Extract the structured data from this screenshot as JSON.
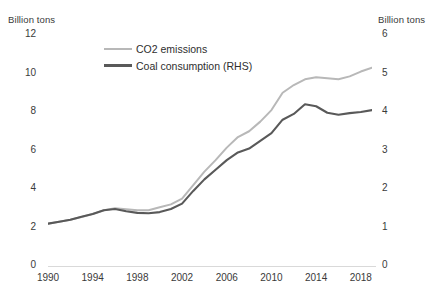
{
  "chart_data": {
    "type": "line",
    "title": "",
    "xlabel": "",
    "left_axis": {
      "label": "Billion tons",
      "ticks": [
        0,
        2,
        4,
        6,
        8,
        10,
        12
      ],
      "ylim": [
        0,
        12
      ]
    },
    "right_axis": {
      "label": "Billion tons",
      "ticks": [
        0,
        1,
        2,
        3,
        4,
        5,
        6
      ],
      "ylim": [
        0,
        6
      ]
    },
    "x": [
      1990,
      1991,
      1992,
      1993,
      1994,
      1995,
      1996,
      1997,
      1998,
      1999,
      2000,
      2001,
      2002,
      2003,
      2004,
      2005,
      2006,
      2007,
      2008,
      2009,
      2010,
      2011,
      2012,
      2013,
      2014,
      2015,
      2016,
      2017,
      2018,
      2019
    ],
    "xticks": [
      1990,
      1994,
      1998,
      2002,
      2006,
      2010,
      2014,
      2018
    ],
    "xlim": [
      1990,
      2019
    ],
    "grid": false,
    "legend_position": "top-left-inside",
    "series": [
      {
        "name": "CO2 emissions",
        "axis": "left",
        "color": "#b8b8b8",
        "unit": "Billion tons",
        "values": [
          2.2,
          2.3,
          2.4,
          2.55,
          2.7,
          2.9,
          3.0,
          2.95,
          2.9,
          2.9,
          3.05,
          3.2,
          3.5,
          4.2,
          4.9,
          5.5,
          6.15,
          6.7,
          7.0,
          7.5,
          8.1,
          9.0,
          9.4,
          9.7,
          9.8,
          9.75,
          9.7,
          9.85,
          10.1,
          10.3
        ],
        "marker": "none"
      },
      {
        "name": "Coal consumption (RHS)",
        "axis": "right",
        "color": "#595959",
        "unit": "Billion tons",
        "values": [
          1.1,
          1.15,
          1.2,
          1.28,
          1.35,
          1.45,
          1.48,
          1.42,
          1.38,
          1.37,
          1.4,
          1.48,
          1.62,
          1.95,
          2.25,
          2.5,
          2.75,
          2.95,
          3.05,
          3.25,
          3.45,
          3.8,
          3.95,
          4.2,
          4.15,
          3.98,
          3.93,
          3.97,
          4.0,
          4.05
        ],
        "marker": "none"
      }
    ],
    "annotations": []
  },
  "legend": {
    "items": [
      {
        "label": "CO2 emissions",
        "color": "#b8b8b8"
      },
      {
        "label": "Coal consumption (RHS)",
        "color": "#595959"
      }
    ]
  },
  "axes": {
    "left_title": "Billion tons",
    "right_title": "Billion tons",
    "left_tick_labels": [
      "12",
      "10",
      "8",
      "6",
      "4",
      "2",
      "0"
    ],
    "right_tick_labels": [
      "6",
      "5",
      "4",
      "3",
      "2",
      "1",
      "0"
    ],
    "x_tick_labels": [
      "1990",
      "1994",
      "1998",
      "2002",
      "2006",
      "2010",
      "2014",
      "2018"
    ]
  }
}
